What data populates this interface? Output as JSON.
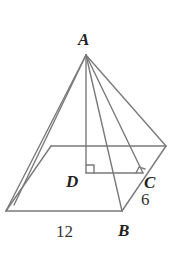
{
  "figure": {
    "type": "square-based pyramid",
    "vertices": {
      "apex": "A",
      "foot_of_height": "D",
      "edge_midpoint": "C",
      "base_corner": "B"
    },
    "labels": {
      "A": "A",
      "B": "B",
      "C": "C",
      "D": "D",
      "base_length": "12",
      "half_side": "6"
    },
    "annotations": {
      "right_angle_at_D": true,
      "right_angle_at_C": true
    }
  }
}
